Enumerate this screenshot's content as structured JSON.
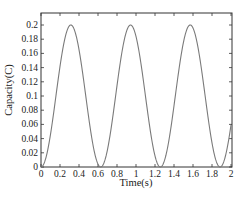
{
  "chart_data": {
    "type": "line",
    "title": "",
    "xlabel": "Time(s)",
    "ylabel": "Capacity(C)",
    "xlim": [
      0,
      2
    ],
    "ylim": [
      0,
      0.21
    ],
    "x_ticks": [
      0,
      0.2,
      0.4,
      0.6,
      0.8,
      1,
      1.2,
      1.4,
      1.6,
      1.8,
      2
    ],
    "x_tick_labels": [
      "0",
      "0.2",
      "0.4",
      "0.6",
      "0.8",
      "1",
      "1.2",
      "1.4",
      "1.6",
      "1.8",
      "2"
    ],
    "y_ticks": [
      0,
      0.02,
      0.04,
      0.06,
      0.08,
      0.1,
      0.12,
      0.14,
      0.16,
      0.18,
      0.2
    ],
    "y_tick_labels": [
      "0",
      "0.02",
      "0.04",
      "0.06",
      "0.08",
      "0.1",
      "0.12",
      "0.14",
      "0.16",
      "0.18",
      "0.2"
    ],
    "grid": false,
    "legend": null,
    "line_color": "#7a7a7a",
    "series": [
      {
        "name": "Capacity",
        "x": [
          0,
          0.05,
          0.1,
          0.15,
          0.2,
          0.25,
          0.3,
          0.314,
          0.35,
          0.4,
          0.45,
          0.5,
          0.55,
          0.6,
          0.628,
          0.65,
          0.7,
          0.75,
          0.8,
          0.85,
          0.9,
          0.942,
          1.0,
          1.05,
          1.1,
          1.15,
          1.2,
          1.257,
          1.3,
          1.35,
          1.4,
          1.45,
          1.5,
          1.571,
          1.6,
          1.65,
          1.7,
          1.75,
          1.8,
          1.885,
          1.9,
          1.95,
          2.0
        ],
        "y": [
          0,
          0.0245,
          0.0919,
          0.1707,
          0.2,
          0.1801,
          0.199,
          0.2,
          0.1936,
          0.1654,
          0.1211,
          0.0716,
          0.0292,
          0.004,
          0.0,
          0.0024,
          0.0246,
          0.065,
          0.1146,
          0.1609,
          0.1911,
          0.2,
          0.1839,
          0.1476,
          0.1004,
          0.0508,
          0.0156,
          0.0,
          0.0098,
          0.0427,
          0.0893,
          0.1392,
          0.1785,
          0.2,
          0.196,
          0.1724,
          0.1293,
          0.0783,
          0.0332,
          0.0,
          0.0012,
          0.0208,
          0.0592
        ]
      }
    ],
    "function_hint": "y = 0.1 * (1 - cos(10 t))"
  }
}
